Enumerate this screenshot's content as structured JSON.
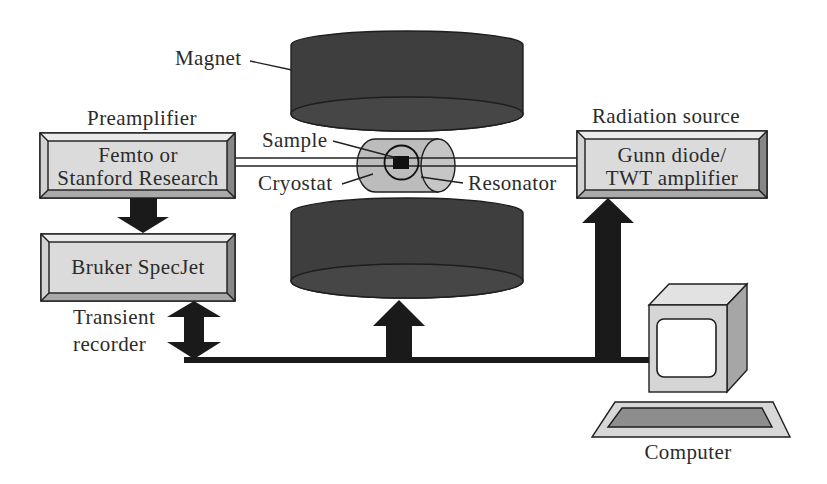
{
  "diagram": {
    "labels": {
      "magnet": "Magnet",
      "preamplifier": "Preamplifier",
      "radiation_source": "Radiation source",
      "sample": "Sample",
      "cryostat": "Cryostat",
      "resonator": "Resonator",
      "transient_recorder": [
        "Transient",
        "recorder"
      ],
      "computer": "Computer"
    },
    "boxes": {
      "preamp": {
        "lines": [
          "Femto or",
          "Stanford Research"
        ]
      },
      "digitizer": {
        "lines": [
          "Bruker SpecJet"
        ]
      },
      "source": {
        "lines": [
          "Gunn diode/",
          "TWT amplifier"
        ]
      }
    },
    "colors": {
      "arrow": "#1a1a1a",
      "magnet_body": "#3e3e3e",
      "magnet_face": "#464646",
      "box_face": "#dbdbdb",
      "bevel_top": "#ebebeb",
      "bevel_left": "#d2d2d2",
      "bevel_bottom": "#a9a9a9",
      "bevel_right": "#878787",
      "cryostat": "#bcbcbc",
      "cryostat_end": "#c6c6c6",
      "computer_front": "#d5d5d5",
      "computer_top": "#e2e2e2",
      "computer_side": "#a6a6a6",
      "keyboard": "#d8d8d8",
      "keyboard_keys": "#8d8d8d"
    }
  }
}
